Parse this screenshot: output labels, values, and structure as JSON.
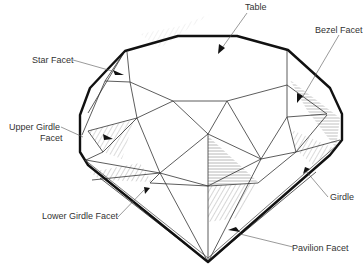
{
  "diagram": {
    "labels": {
      "table": "Table",
      "bezel_facet": "Bezel Facet",
      "star_facet": "Star Facet",
      "upper_girdle_facet_line1": "Upper Girdle",
      "upper_girdle_facet_line2": "Facet",
      "lower_girdle_facet": "Lower Girdle Facet",
      "girdle": "Girdle",
      "pavilion_facet": "Pavilion Facet"
    },
    "colors": {
      "outline": "#111111",
      "facet_line": "#333333",
      "hatch": "#9a9a9a",
      "label_text": "#333333"
    }
  }
}
